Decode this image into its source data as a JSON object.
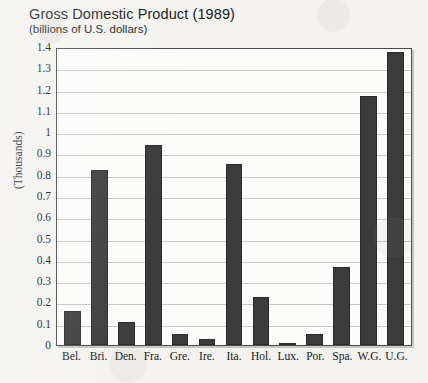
{
  "chart_data": {
    "type": "bar",
    "title": "Gross Domestic Product (1989)",
    "subtitle": "(billions of U.S. dollars)",
    "xlabel": "",
    "ylabel": "(Thousands)",
    "ylim": [
      0,
      1.4
    ],
    "ytick_labels": [
      "1.4",
      "1.3",
      "1.2",
      "1.1",
      "1",
      "0.9",
      "0.8",
      "0.7",
      "0.6",
      "0.5",
      "0.4",
      "0.3",
      "0.2",
      "0.1",
      "0"
    ],
    "ytick_values": [
      1.4,
      1.3,
      1.2,
      1.1,
      1.0,
      0.9,
      0.8,
      0.7,
      0.6,
      0.5,
      0.4,
      0.3,
      0.2,
      0.1,
      0
    ],
    "grid": true,
    "legend": "none",
    "categories": [
      "Bel.",
      "Bri.",
      "Den.",
      "Fra.",
      "Gre.",
      "Ire.",
      "Ita.",
      "Hol.",
      "Lux.",
      "Por.",
      "Spa.",
      "W.G.",
      "U.G."
    ],
    "values": [
      0.16,
      0.83,
      0.11,
      0.95,
      0.05,
      0.03,
      0.86,
      0.23,
      0.01,
      0.05,
      0.37,
      1.18,
      1.39
    ],
    "bar_color": "#3b3b3c"
  }
}
